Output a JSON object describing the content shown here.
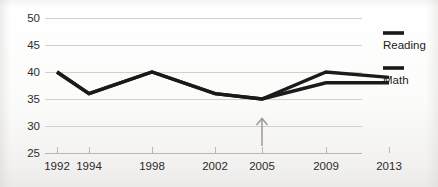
{
  "chart_data": {
    "type": "line",
    "title": "",
    "xlabel": "",
    "ylabel": "",
    "x": [
      1992,
      1994,
      1998,
      2002,
      2005,
      2009,
      2013
    ],
    "categories": [
      "1992",
      "1994",
      "1998",
      "2002",
      "2005",
      "2009",
      "2013"
    ],
    "series": [
      {
        "name": "Reading",
        "values": [
          40,
          36,
          40,
          36,
          35,
          40,
          39
        ],
        "color": "#1a1a1a"
      },
      {
        "name": "Math",
        "values": [
          40,
          36,
          40,
          36,
          35,
          38,
          38
        ],
        "color": "#1a1a1a"
      }
    ],
    "ylim": [
      25,
      50
    ],
    "yticks": [
      25,
      30,
      35,
      40,
      45,
      50
    ],
    "ytick_labels": [
      "25",
      "30",
      "35",
      "40",
      "45",
      "50"
    ],
    "xtick_labels": [
      "1992",
      "1994",
      "1998",
      "2002",
      "2005",
      "2009",
      "2013"
    ],
    "grid": true,
    "legend_position": "right",
    "annotations": [
      {
        "name": "arrow-2005",
        "type": "arrow-up",
        "x": 2005,
        "label": ""
      }
    ],
    "note": "Series overlap and are identical from 1992 through 2005; they diverge after 2005."
  },
  "legend": {
    "items": [
      {
        "label": "Reading"
      },
      {
        "label": "Math"
      }
    ]
  },
  "axes": {
    "y_tick_labels": [
      "50",
      "45",
      "40",
      "35",
      "30",
      "25"
    ],
    "x_tick_labels": [
      "1992",
      "1994",
      "1998",
      "2002",
      "2005",
      "2009",
      "2013"
    ]
  }
}
